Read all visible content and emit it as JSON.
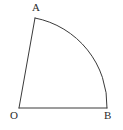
{
  "figure": {
    "type": "geometry-diagram",
    "background_color": "#ffffff",
    "stroke_color": "#3a3a3a",
    "label_color": "#2b2b2b",
    "stroke_width": 1,
    "canvas": {
      "width": 123,
      "height": 130
    },
    "points": {
      "O": {
        "label": "O",
        "x": 19,
        "y": 108
      },
      "A": {
        "label": "A",
        "x": 35,
        "y": 18
      },
      "B": {
        "label": "B",
        "x": 107,
        "y": 108
      }
    },
    "segments": [
      {
        "name": "OA",
        "from": "O",
        "to": "A"
      },
      {
        "name": "OB",
        "from": "O",
        "to": "B"
      }
    ],
    "arc": {
      "name": "AB",
      "from": "A",
      "to": "B",
      "centre": "O",
      "radius": 89,
      "path": "M 35 18 A 89 89 0 0 1 107 108"
    }
  },
  "labels": {
    "A": "A",
    "O": "O",
    "B": "B"
  }
}
